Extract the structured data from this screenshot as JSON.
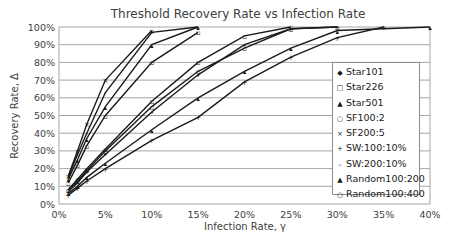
{
  "chart_data": {
    "type": "line",
    "title": "Threshold Recovery Rate vs Infection Rate",
    "xlabel": "Infection Rate, γ",
    "ylabel": "Recovery Rate, Δ",
    "xlim": [
      0,
      40
    ],
    "ylim": [
      0,
      100
    ],
    "x_ticks": [
      "0%",
      "5%",
      "10%",
      "15%",
      "20%",
      "25%",
      "30%",
      "35%",
      "40%"
    ],
    "y_ticks": [
      "0%",
      "10%",
      "20%",
      "30%",
      "40%",
      "50%",
      "60%",
      "70%",
      "80%",
      "90%",
      "100%"
    ],
    "grid": "horizontal",
    "legend_position": "right-inside",
    "series": [
      {
        "name": "Star101",
        "marker": "•",
        "x": [
          1,
          2,
          3,
          5,
          10,
          15,
          20,
          25,
          30
        ],
        "y": [
          7,
          12,
          18,
          28,
          52,
          73,
          90,
          99,
          100
        ]
      },
      {
        "name": "Star226",
        "marker": "▫",
        "x": [
          1,
          2,
          3,
          5,
          10,
          15
        ],
        "y": [
          12,
          22,
          33,
          50,
          80,
          97
        ]
      },
      {
        "name": "Star501",
        "marker": "▴",
        "x": [
          1,
          2,
          3,
          5,
          10,
          15
        ],
        "y": [
          14,
          25,
          37,
          55,
          90,
          100
        ]
      },
      {
        "name": "SF100:2",
        "marker": "▫",
        "x": [
          1,
          2,
          3,
          5,
          10,
          15,
          20,
          25
        ],
        "y": [
          8,
          14,
          20,
          31,
          58,
          80,
          95,
          100
        ]
      },
      {
        "name": "SF200:5",
        "marker": "×",
        "x": [
          1,
          2,
          3,
          5,
          10
        ],
        "y": [
          16,
          30,
          45,
          70,
          98
        ]
      },
      {
        "name": "SW:100:10%",
        "marker": "+",
        "x": [
          1,
          2,
          3,
          5,
          10,
          15,
          20,
          25,
          30,
          35
        ],
        "y": [
          5,
          9,
          13,
          20,
          36,
          49,
          69,
          83,
          94,
          100
        ]
      },
      {
        "name": "SW:200:10%",
        "marker": "-",
        "x": [
          1,
          2,
          3,
          5,
          10,
          15
        ],
        "y": [
          15,
          28,
          40,
          63,
          97,
          100
        ]
      },
      {
        "name": "Random100:200",
        "marker": "▴",
        "x": [
          1,
          2,
          3,
          5,
          10,
          15,
          20,
          25,
          30,
          40
        ],
        "y": [
          6,
          10,
          15,
          23,
          42,
          60,
          75,
          88,
          98,
          100
        ]
      },
      {
        "name": "Random100:400",
        "marker": "▫",
        "x": [
          1,
          2,
          3,
          5,
          10,
          15,
          20,
          25,
          30
        ],
        "y": [
          8,
          13,
          19,
          30,
          55,
          75,
          88,
          99,
          100
        ]
      }
    ]
  },
  "legend": {
    "items": [
      {
        "label": "Star101",
        "marker": "◆"
      },
      {
        "label": "Star226",
        "marker": "□"
      },
      {
        "label": "Star501",
        "marker": "▲"
      },
      {
        "label": "SF100:2",
        "marker": "○"
      },
      {
        "label": "SF200:5",
        "marker": "×"
      },
      {
        "label": "SW:100:10%",
        "marker": "+"
      },
      {
        "label": "SW:200:10%",
        "marker": "–"
      },
      {
        "label": "Random100:200",
        "marker": "▲"
      },
      {
        "label": "Random100:400",
        "marker": "○"
      }
    ]
  }
}
